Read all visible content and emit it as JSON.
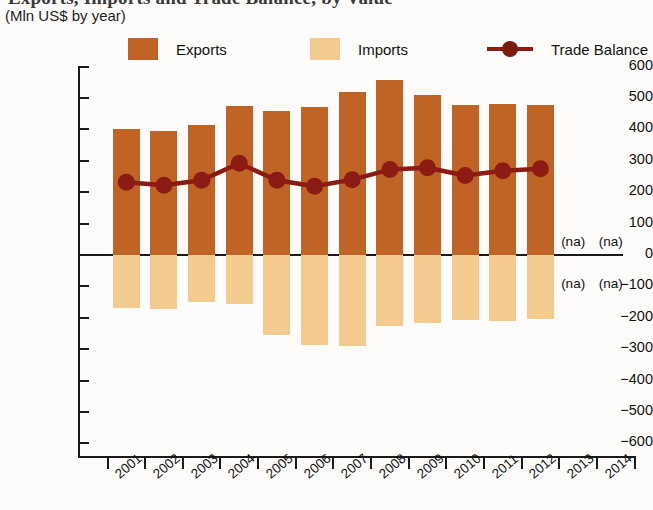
{
  "header": {
    "title": "Exports, Imports and Trade Balance, by Value",
    "subtitle": "(Mln US$ by year)"
  },
  "legend": {
    "position": "top",
    "items": [
      {
        "label": "Exports",
        "type": "swatch",
        "color": "#BF6425",
        "icon": "square-swatch"
      },
      {
        "label": "Imports",
        "type": "swatch",
        "color": "#F4CB8F",
        "icon": "square-swatch"
      },
      {
        "label": "Trade Balance",
        "type": "line-marker",
        "color": "#8C1C13",
        "icon": "line-with-dot-marker"
      }
    ]
  },
  "axes": {
    "y_ticks": [
      "600",
      "500",
      "400",
      "300",
      "200",
      "100",
      "0",
      "−100",
      "−200",
      "−300",
      "−400",
      "−500",
      "−600"
    ],
    "x_ticks": [
      "2001",
      "2002",
      "2003",
      "2004",
      "2005",
      "2006",
      "2007",
      "2008",
      "2009",
      "2010",
      "2011",
      "2012",
      "2013",
      "2014"
    ]
  },
  "annotations": {
    "na_text": "(na)",
    "na_positions": [
      "2013-positive",
      "2014-positive",
      "2013-negative",
      "2014-negative"
    ]
  },
  "chart_data": {
    "type": "bar",
    "title": "Exports, Imports and Trade Balance, by Value",
    "subtitle": "(Mln US$ by year)",
    "xlabel": "",
    "ylabel": "Mln US$",
    "ylim": [
      -600,
      600
    ],
    "ytick_step": 100,
    "grid": false,
    "legend_position": "top",
    "categories": [
      "2001",
      "2002",
      "2003",
      "2004",
      "2005",
      "2006",
      "2007",
      "2008",
      "2009",
      "2010",
      "2011",
      "2012",
      "2013",
      "2014"
    ],
    "series": [
      {
        "name": "Exports",
        "type": "bar",
        "color": "#BF6425",
        "values": [
          400,
          395,
          415,
          475,
          458,
          470,
          520,
          558,
          508,
          478,
          480,
          478,
          null,
          null
        ]
      },
      {
        "name": "Imports",
        "type": "bar",
        "color": "#F4CB8F",
        "note": "plotted as negative values below the zero line",
        "values": [
          -168,
          -172,
          -150,
          -155,
          -255,
          -288,
          -290,
          -225,
          -218,
          -208,
          -210,
          -205,
          null,
          null
        ]
      },
      {
        "name": "Trade Balance",
        "type": "line",
        "color": "#8C1C13",
        "marker": "circle",
        "values": [
          232,
          222,
          238,
          292,
          238,
          219,
          240,
          272,
          278,
          253,
          268,
          275,
          null,
          null
        ]
      }
    ],
    "missing_data_label": "(na)",
    "missing_data_categories": [
      "2013",
      "2014"
    ]
  }
}
